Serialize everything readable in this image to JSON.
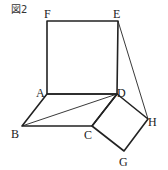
{
  "figure": {
    "title": "図2",
    "points": {
      "F": {
        "label": "F",
        "x": 47,
        "y": 21
      },
      "E": {
        "label": "E",
        "x": 118,
        "y": 21
      },
      "A": {
        "label": "A",
        "x": 47,
        "y": 94
      },
      "D": {
        "label": "D",
        "x": 117,
        "y": 94
      },
      "B": {
        "label": "B",
        "x": 22,
        "y": 126
      },
      "C": {
        "label": "C",
        "x": 92,
        "y": 126
      },
      "H": {
        "label": "H",
        "x": 148,
        "y": 119
      },
      "G": {
        "label": "G",
        "x": 124,
        "y": 151
      }
    },
    "segments": {
      "square_AFED": [
        "A",
        "F",
        "E",
        "D"
      ],
      "parallelogram_ABCD": [
        "A",
        "B",
        "C",
        "D"
      ],
      "square_DCGH": [
        "D",
        "C",
        "G",
        "H"
      ],
      "diagonal_BD": [
        "B",
        "D"
      ],
      "line_EH": [
        "E",
        "H"
      ]
    },
    "colors": {
      "stroke": "#222222",
      "background": "#ffffff"
    }
  }
}
